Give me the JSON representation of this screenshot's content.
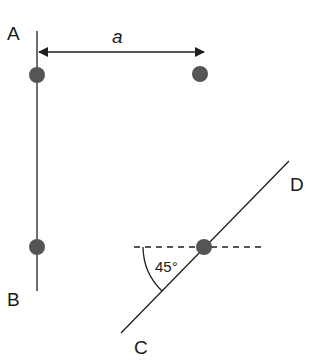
{
  "diagram": {
    "labels": {
      "A": "A",
      "B": "B",
      "C": "C",
      "D": "D",
      "distance": "a",
      "angle": "45°"
    },
    "colors": {
      "line": "#1f1f1f",
      "dot": "#555555",
      "background": "#ffffff"
    },
    "elements": {
      "rod_AB": "vertical line A–B",
      "rod_CD": "diagonal line C–D at 45°",
      "dashed_reference": "horizontal dashed line",
      "distance_arrow": "double-headed arrow of length a"
    }
  }
}
